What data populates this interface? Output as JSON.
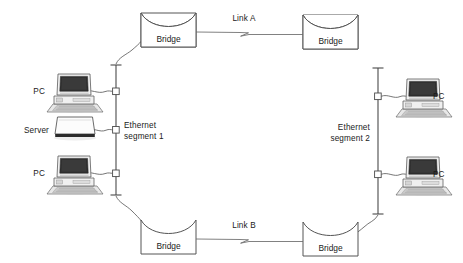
{
  "diagram": {
    "background_color": "#ffffff",
    "line_color": "#545454",
    "text_color": "#1a1a1a",
    "labels": {
      "pc_top_left": "PC",
      "server": "Server",
      "pc_bottom_left": "PC",
      "pc_top_right": "PC",
      "pc_bottom_right": "PC",
      "segment_1_line_1": "Ethernet",
      "segment_1_line_2": "segment 1",
      "segment_2_line_1": "Ethernet",
      "segment_2_line_2": "segment 2",
      "link_a": "Link A",
      "link_b": "Link B",
      "bridge_top_left": "Bridge",
      "bridge_top_right": "Bridge",
      "bridge_bottom_left": "Bridge",
      "bridge_bottom_right": "Bridge"
    },
    "nodes": [
      {
        "name": "bridge-top-left",
        "label": "Bridge",
        "x": 168,
        "y": 31
      },
      {
        "name": "bridge-top-right",
        "label": "Bridge",
        "x": 330,
        "y": 33
      },
      {
        "name": "bridge-bottom-left",
        "label": "Bridge",
        "x": 168,
        "y": 238
      },
      {
        "name": "bridge-bottom-right",
        "label": "Bridge",
        "x": 330,
        "y": 240
      }
    ],
    "segments": [
      {
        "name": "ethernet-segment-1",
        "label": "Ethernet segment 1",
        "taps": 3
      },
      {
        "name": "ethernet-segment-2",
        "label": "Ethernet segment 2",
        "taps": 2
      }
    ],
    "links": [
      {
        "name": "link-a",
        "label": "Link A",
        "from": "bridge-top-left",
        "to": "bridge-top-right"
      },
      {
        "name": "link-b",
        "label": "Link B",
        "from": "bridge-bottom-left",
        "to": "bridge-bottom-right"
      }
    ]
  }
}
